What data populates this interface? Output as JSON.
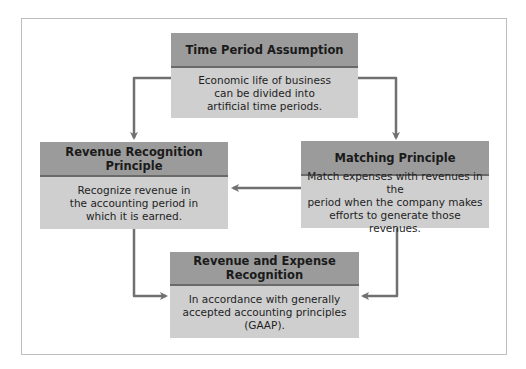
{
  "diagram": {
    "boxes": {
      "time_period": {
        "title": "Time Period Assumption",
        "lines": [
          "Economic life of business",
          "can be divided into",
          "artificial time periods."
        ]
      },
      "revenue_recognition": {
        "title_lines": [
          "Revenue Recognition",
          "Principle"
        ],
        "lines": [
          "Recognize revenue  in",
          "the accounting period in",
          "which it is earned."
        ]
      },
      "matching": {
        "title": "Matching Principle",
        "lines": [
          "Match expenses with revenues in the",
          "period when the company makes",
          "efforts to generate those revenues."
        ]
      },
      "revenue_expense": {
        "title_lines": [
          "Revenue and Expense",
          "Recognition"
        ],
        "lines": [
          "In accordance with generally",
          "accepted accounting principles",
          "(GAAP)."
        ]
      }
    },
    "colors": {
      "header": "#9b9b9b",
      "header_border": "#6a6a6a",
      "body": "#cfcfcf",
      "arrow": "#707070",
      "frame": "#bdbdbd"
    }
  }
}
